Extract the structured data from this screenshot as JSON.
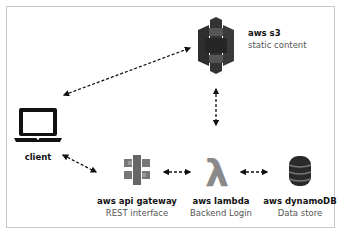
{
  "diagram": {
    "nodes": {
      "client": {
        "title": "client",
        "icon": "laptop-icon"
      },
      "s3": {
        "title": "aws s3",
        "subtitle": "static content",
        "icon": "aws-s3-icon"
      },
      "api_gateway": {
        "title": "aws api gateway",
        "subtitle": "REST interface",
        "icon": "aws-api-gateway-icon"
      },
      "lambda": {
        "title": "aws lambda",
        "subtitle": "Backend Login",
        "icon": "aws-lambda-icon",
        "glyph": "λ"
      },
      "dynamodb": {
        "title": "aws dynamoDB",
        "subtitle": "Data store",
        "icon": "aws-dynamodb-icon"
      }
    },
    "edges": [
      {
        "from": "client",
        "to": "s3",
        "style": "dashed",
        "direction": "bidirectional"
      },
      {
        "from": "s3",
        "to": "lambda",
        "style": "dashed",
        "direction": "bidirectional"
      },
      {
        "from": "client",
        "to": "api_gateway",
        "style": "dashed",
        "direction": "bidirectional"
      },
      {
        "from": "api_gateway",
        "to": "lambda",
        "style": "dashed",
        "direction": "bidirectional"
      },
      {
        "from": "lambda",
        "to": "dynamodb",
        "style": "dashed",
        "direction": "bidirectional"
      }
    ],
    "colors": {
      "icon_dark": "#2b2b2b",
      "icon_gray": "#8a8a8a",
      "arrow": "#111111",
      "frame": "#c9c9c9"
    }
  }
}
